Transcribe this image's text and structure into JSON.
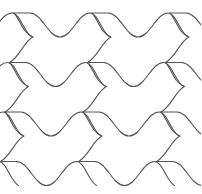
{
  "figure": {
    "stroke_color": "#555555",
    "background": "#ffffff",
    "tile": {
      "period_x": 78,
      "row_step": {
        "dx": -4.3,
        "dy": 49.5
      }
    },
    "rows": [
      {
        "origin_x": 14,
        "origin_y": 13
      },
      {
        "origin_x": 9.5,
        "origin_y": 62.5
      },
      {
        "origin_x": 5,
        "origin_y": 112
      },
      {
        "origin_x": 0.5,
        "origin_y": 161.5
      }
    ],
    "columns": 3
  }
}
